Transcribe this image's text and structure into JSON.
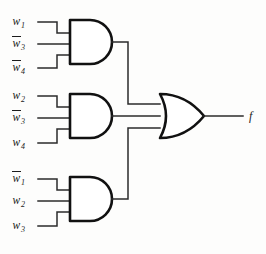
{
  "diagram": {
    "output": {
      "label": "f",
      "name": "output-signal"
    },
    "and_gates": [
      {
        "id": "and-gate-1",
        "type": "AND",
        "inputs": [
          {
            "var": "w",
            "index": "1",
            "negated": false
          },
          {
            "var": "w",
            "index": "3",
            "negated": true
          },
          {
            "var": "w",
            "index": "4",
            "negated": true
          }
        ]
      },
      {
        "id": "and-gate-2",
        "type": "AND",
        "inputs": [
          {
            "var": "w",
            "index": "2",
            "negated": false
          },
          {
            "var": "w",
            "index": "3",
            "negated": true
          },
          {
            "var": "w",
            "index": "4",
            "negated": false
          }
        ]
      },
      {
        "id": "and-gate-3",
        "type": "AND",
        "inputs": [
          {
            "var": "w",
            "index": "1",
            "negated": true
          },
          {
            "var": "w",
            "index": "2",
            "negated": false
          },
          {
            "var": "w",
            "index": "3",
            "negated": false
          }
        ]
      }
    ],
    "or_gate": {
      "id": "or-gate-1",
      "type": "OR",
      "input_count": 3
    },
    "colors": {
      "wire": "#2b2b2b",
      "gate_outline": "#111111",
      "gate_fill": "#ffffff",
      "text": "#1b1b1b",
      "background": "#fdfdfc"
    },
    "labels": {
      "g1i1": "w1",
      "g1i2": "w3",
      "g1i3": "w4",
      "g2i1": "w2",
      "g2i2": "w3",
      "g2i3": "w4",
      "g3i1": "w1",
      "g3i2": "w2",
      "g3i3": "w3"
    }
  }
}
